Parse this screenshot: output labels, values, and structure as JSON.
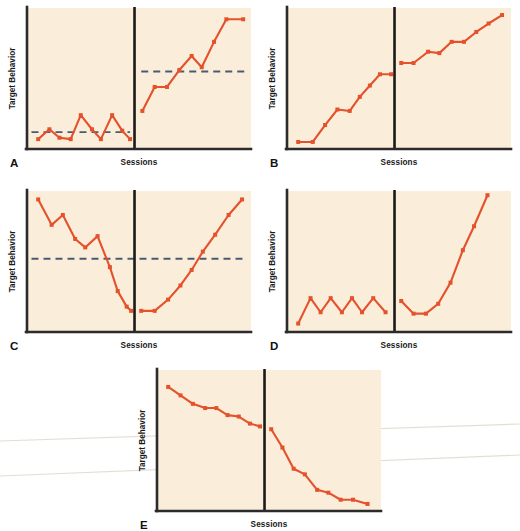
{
  "figure": {
    "title": "",
    "background_color": "#ffffff",
    "plot_background_color": "#faeedb",
    "series_color": "#e4512b",
    "criterion_color": "#4a5a72",
    "axis_color": "#2b2b2b",
    "panel_count": 5
  },
  "labels": {
    "y_axis": "Target Behavior",
    "x_axis": "Sessions"
  },
  "panels": [
    {
      "letter": "A",
      "ylabel": "Target Behavior",
      "xlabel": "Sessions"
    },
    {
      "letter": "B",
      "ylabel": "Target Behavior",
      "xlabel": "Sessions"
    },
    {
      "letter": "C",
      "ylabel": "Target Behavior",
      "xlabel": "Sessions"
    },
    {
      "letter": "D",
      "ylabel": "Target Behavior",
      "xlabel": "Sessions"
    },
    {
      "letter": "E",
      "ylabel": "Target Behavior",
      "xlabel": "Sessions"
    }
  ],
  "chart_data": [
    {
      "id": "A",
      "type": "line",
      "title": "A",
      "xlabel": "Sessions",
      "ylabel": "Target Behavior",
      "xlim": [
        0,
        20
      ],
      "ylim": [
        0,
        100
      ],
      "grid": false,
      "legend": "none",
      "phase_divider_x": 9.6,
      "annotations": [
        {
          "kind": "criterion-line",
          "label": "baseline criterion",
          "y": 12,
          "x_from": 0.4,
          "x_to": 9.2,
          "style": "dashed"
        },
        {
          "kind": "criterion-line",
          "label": "treatment criterion",
          "y": 55,
          "x_from": 10.2,
          "x_to": 19.6,
          "style": "dashed"
        }
      ],
      "series": [
        {
          "name": "baseline",
          "phase": "baseline",
          "x": [
            1.0,
            2.0,
            3.0,
            4.0,
            5.1,
            6.1,
            7.1,
            8.1,
            9.0
          ],
          "values": [
            7,
            10,
            17,
            7,
            24,
            10,
            7,
            24,
            12,
            7
          ],
          "points": [
            {
              "x": 1.0,
              "y": 7
            },
            {
              "x": 2.0,
              "y": 14
            },
            {
              "x": 2.9,
              "y": 8
            },
            {
              "x": 3.9,
              "y": 7
            },
            {
              "x": 4.8,
              "y": 24
            },
            {
              "x": 5.8,
              "y": 14
            },
            {
              "x": 6.6,
              "y": 7
            },
            {
              "x": 7.6,
              "y": 24
            },
            {
              "x": 8.5,
              "y": 13
            },
            {
              "x": 9.2,
              "y": 7
            }
          ]
        },
        {
          "name": "treatment",
          "phase": "treatment",
          "points": [
            {
              "x": 10.3,
              "y": 27
            },
            {
              "x": 11.4,
              "y": 44
            },
            {
              "x": 12.5,
              "y": 44
            },
            {
              "x": 13.6,
              "y": 56
            },
            {
              "x": 14.7,
              "y": 66
            },
            {
              "x": 15.6,
              "y": 58
            },
            {
              "x": 16.7,
              "y": 76
            },
            {
              "x": 17.8,
              "y": 92
            },
            {
              "x": 19.3,
              "y": 92
            }
          ]
        }
      ]
    },
    {
      "id": "B",
      "type": "line",
      "title": "B",
      "xlabel": "Sessions",
      "ylabel": "Target Behavior",
      "xlim": [
        0,
        20
      ],
      "ylim": [
        0,
        100
      ],
      "grid": false,
      "legend": "none",
      "phase_divider_x": 9.6,
      "annotations": [],
      "series": [
        {
          "name": "baseline",
          "phase": "baseline",
          "points": [
            {
              "x": 1.0,
              "y": 5
            },
            {
              "x": 2.3,
              "y": 5
            },
            {
              "x": 3.4,
              "y": 17
            },
            {
              "x": 4.5,
              "y": 28
            },
            {
              "x": 5.6,
              "y": 27
            },
            {
              "x": 6.5,
              "y": 37
            },
            {
              "x": 7.4,
              "y": 45
            },
            {
              "x": 8.3,
              "y": 53
            },
            {
              "x": 9.3,
              "y": 53
            }
          ]
        },
        {
          "name": "treatment",
          "phase": "treatment",
          "points": [
            {
              "x": 10.2,
              "y": 61
            },
            {
              "x": 11.3,
              "y": 61
            },
            {
              "x": 12.6,
              "y": 69
            },
            {
              "x": 13.6,
              "y": 68
            },
            {
              "x": 14.7,
              "y": 76
            },
            {
              "x": 15.8,
              "y": 76
            },
            {
              "x": 16.9,
              "y": 83
            },
            {
              "x": 18.0,
              "y": 89
            },
            {
              "x": 19.2,
              "y": 95
            }
          ]
        }
      ]
    },
    {
      "id": "C",
      "type": "line",
      "title": "C",
      "xlabel": "Sessions",
      "ylabel": "Target Behavior",
      "xlim": [
        0,
        20
      ],
      "ylim": [
        0,
        100
      ],
      "grid": false,
      "legend": "none",
      "phase_divider_x": 9.6,
      "annotations": [
        {
          "kind": "criterion-line",
          "label": "criterion",
          "y": 52,
          "x_from": 0.4,
          "x_to": 19.6,
          "style": "dashed"
        }
      ],
      "series": [
        {
          "name": "baseline",
          "phase": "baseline",
          "points": [
            {
              "x": 1.0,
              "y": 94
            },
            {
              "x": 2.2,
              "y": 76
            },
            {
              "x": 3.2,
              "y": 83
            },
            {
              "x": 4.3,
              "y": 66
            },
            {
              "x": 5.2,
              "y": 60
            },
            {
              "x": 6.3,
              "y": 68
            },
            {
              "x": 7.4,
              "y": 46
            },
            {
              "x": 8.1,
              "y": 29
            },
            {
              "x": 8.9,
              "y": 18
            },
            {
              "x": 9.3,
              "y": 15
            }
          ]
        },
        {
          "name": "treatment",
          "phase": "treatment",
          "points": [
            {
              "x": 10.2,
              "y": 15
            },
            {
              "x": 11.4,
              "y": 15
            },
            {
              "x": 12.6,
              "y": 23
            },
            {
              "x": 13.7,
              "y": 33
            },
            {
              "x": 14.7,
              "y": 44
            },
            {
              "x": 15.7,
              "y": 57
            },
            {
              "x": 16.8,
              "y": 69
            },
            {
              "x": 18.0,
              "y": 83
            },
            {
              "x": 19.2,
              "y": 94
            }
          ]
        }
      ]
    },
    {
      "id": "D",
      "type": "line",
      "title": "D",
      "xlabel": "Sessions",
      "ylabel": "Target Behavior",
      "xlim": [
        0,
        20
      ],
      "ylim": [
        0,
        100
      ],
      "grid": false,
      "legend": "none",
      "phase_divider_x": 9.6,
      "annotations": [],
      "series": [
        {
          "name": "baseline",
          "phase": "baseline",
          "points": [
            {
              "x": 1.0,
              "y": 6
            },
            {
              "x": 2.1,
              "y": 24
            },
            {
              "x": 3.0,
              "y": 14
            },
            {
              "x": 3.9,
              "y": 24
            },
            {
              "x": 4.9,
              "y": 14
            },
            {
              "x": 5.8,
              "y": 24
            },
            {
              "x": 6.7,
              "y": 14
            },
            {
              "x": 7.7,
              "y": 24
            },
            {
              "x": 8.8,
              "y": 14
            }
          ]
        },
        {
          "name": "treatment",
          "phase": "treatment",
          "points": [
            {
              "x": 10.2,
              "y": 22
            },
            {
              "x": 11.3,
              "y": 13
            },
            {
              "x": 12.4,
              "y": 13
            },
            {
              "x": 13.5,
              "y": 20
            },
            {
              "x": 14.6,
              "y": 35
            },
            {
              "x": 15.7,
              "y": 58
            },
            {
              "x": 16.7,
              "y": 75
            },
            {
              "x": 17.9,
              "y": 97
            }
          ]
        }
      ]
    },
    {
      "id": "E",
      "type": "line",
      "title": "E",
      "xlabel": "Sessions",
      "ylabel": "Target Behavior",
      "xlim": [
        0,
        20
      ],
      "ylim": [
        0,
        100
      ],
      "grid": false,
      "legend": "none",
      "phase_divider_x": 9.6,
      "annotations": [],
      "series": [
        {
          "name": "baseline",
          "phase": "baseline",
          "points": [
            {
              "x": 1.0,
              "y": 88
            },
            {
              "x": 2.1,
              "y": 82
            },
            {
              "x": 3.2,
              "y": 76
            },
            {
              "x": 4.3,
              "y": 73
            },
            {
              "x": 5.3,
              "y": 73
            },
            {
              "x": 6.3,
              "y": 68
            },
            {
              "x": 7.3,
              "y": 67
            },
            {
              "x": 8.3,
              "y": 62
            },
            {
              "x": 9.2,
              "y": 60
            }
          ]
        },
        {
          "name": "treatment",
          "phase": "treatment",
          "points": [
            {
              "x": 10.2,
              "y": 58
            },
            {
              "x": 11.2,
              "y": 45
            },
            {
              "x": 12.2,
              "y": 30
            },
            {
              "x": 13.2,
              "y": 26
            },
            {
              "x": 14.3,
              "y": 15
            },
            {
              "x": 15.3,
              "y": 13
            },
            {
              "x": 16.4,
              "y": 8
            },
            {
              "x": 17.5,
              "y": 8
            },
            {
              "x": 18.8,
              "y": 5
            }
          ]
        }
      ]
    }
  ],
  "artifacts": {
    "scan_lines": [
      {
        "x1": 0,
        "y1": 441,
        "x2": 520,
        "y2": 424
      },
      {
        "x1": 0,
        "y1": 476,
        "x2": 520,
        "y2": 455
      }
    ]
  }
}
